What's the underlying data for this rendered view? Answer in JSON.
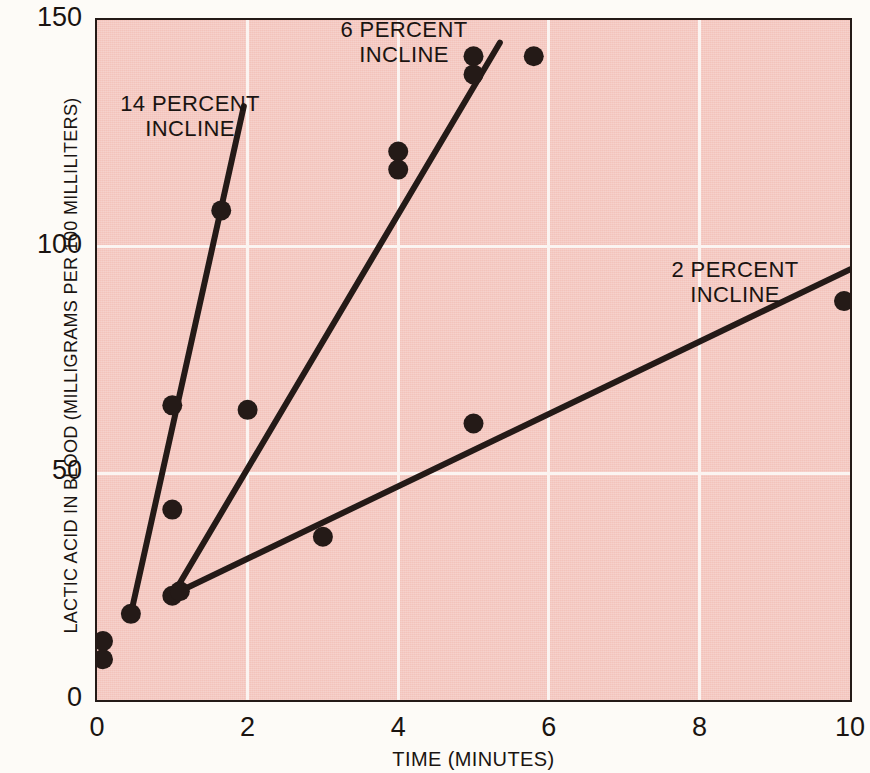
{
  "chart_data": {
    "type": "scatter",
    "title": "",
    "xlabel": "TIME (MINUTES)",
    "ylabel": "LACTIC ACID IN BLOOD (MILLIGRAMS PER 100 MILLILITERS)",
    "xlim": [
      0,
      10
    ],
    "ylim": [
      0,
      150
    ],
    "xticks": [
      "0",
      "2",
      "4",
      "6",
      "8",
      "10"
    ],
    "xtick_values": [
      0,
      2,
      4,
      6,
      8,
      10
    ],
    "yticks": [
      "0",
      "50",
      "100",
      "150"
    ],
    "ytick_values": [
      0,
      50,
      100,
      150
    ],
    "grid": true,
    "grid_color": "#fbf4f1",
    "plot_background": "#f3c3bb",
    "page_background": "#fdfbf7",
    "marker_color": "#241a17",
    "line_color": "#241a17",
    "legend_position": "inline-annotations",
    "series": [
      {
        "name": "14 PERCENT INCLINE",
        "label": "14 PERCENT\nINCLINE",
        "points": [
          [
            0.0,
            13
          ],
          [
            0.0,
            9
          ],
          [
            0.45,
            19
          ],
          [
            1.0,
            42
          ],
          [
            1.0,
            65
          ],
          [
            1.65,
            108
          ]
        ],
        "fit_line": [
          [
            0.45,
            19
          ],
          [
            1.95,
            131
          ]
        ]
      },
      {
        "name": "6 PERCENT INCLINE",
        "label": "6 PERCENT\nINCLINE",
        "points": [
          [
            1.0,
            23
          ],
          [
            2.0,
            64
          ],
          [
            4.0,
            121
          ],
          [
            4.0,
            117
          ],
          [
            5.0,
            142
          ],
          [
            5.0,
            138
          ],
          [
            5.8,
            142
          ]
        ],
        "fit_line": [
          [
            1.0,
            23
          ],
          [
            5.35,
            145
          ]
        ]
      },
      {
        "name": "2 PERCENT INCLINE",
        "label": "2 PERCENT\nINCLINE",
        "points": [
          [
            1.1,
            24
          ],
          [
            3.0,
            36
          ],
          [
            5.0,
            61
          ],
          [
            10.0,
            88
          ]
        ],
        "fit_line": [
          [
            1.1,
            24
          ],
          [
            10.0,
            95
          ]
        ]
      }
    ]
  }
}
